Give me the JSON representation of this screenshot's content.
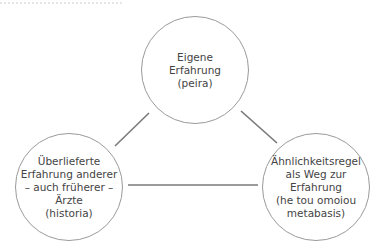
{
  "diagram": {
    "type": "triangle-concept-map",
    "nodes": [
      {
        "id": "peira",
        "label": "Eigene\nErfahrung\n(peira)",
        "center": [
          195,
          70
        ],
        "radius": 54
      },
      {
        "id": "historia",
        "label": "Überlieferte\nErfahrung anderer\n– auch früherer –\nÄrzte\n(historia)",
        "center": [
          69,
          187
        ],
        "radius": 54
      },
      {
        "id": "metabasis",
        "label": "Ähnlichkeitsregel\nals Weg zur\nErfahrung\n(he tou omoiou\nmetabasis)",
        "center": [
          316,
          187
        ],
        "radius": 54
      }
    ],
    "edges": [
      {
        "from": "peira",
        "to": "historia",
        "x1": 115,
        "y1": 146,
        "x2": 149,
        "y2": 113
      },
      {
        "from": "peira",
        "to": "metabasis",
        "x1": 241,
        "y1": 111,
        "x2": 277,
        "y2": 143
      },
      {
        "from": "historia",
        "to": "metabasis",
        "x1": 128,
        "y1": 185,
        "x2": 258,
        "y2": 185
      }
    ],
    "colors": {
      "circle_stroke": "#9a9a9a",
      "edge_stroke": "#7a7a7a",
      "text": "#444444"
    }
  }
}
